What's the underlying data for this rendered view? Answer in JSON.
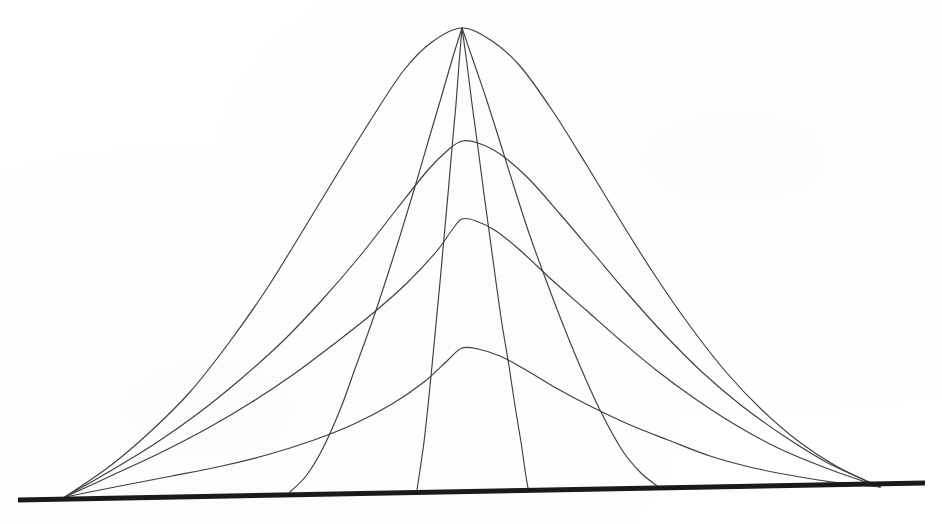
{
  "figure": {
    "title": "Family of bell-shaped curves with characteristic lines",
    "background_color": "#ffffff",
    "curve_color": "#3f3f3f",
    "baseline_color": "#1a1a1a",
    "curve_stroke_width": 1.15,
    "baseline_stroke_width": 5.0
  },
  "chart_data": {
    "type": "line",
    "title": "",
    "subtitle": "",
    "xlabel": "",
    "ylabel": "",
    "xlim": [
      18,
      925
    ],
    "ylim": [
      28,
      500
    ],
    "grid": false,
    "legend": "none",
    "axis": {
      "name": "baseline",
      "x_start": 18,
      "y_start": 500,
      "x_end": 925,
      "y_end": 483,
      "thickness_px": 5,
      "tilt": "slightly rising left-to-right"
    },
    "anchors": {
      "left_foot": {
        "x": 65,
        "y": 497
      },
      "right_foot": {
        "x": 880,
        "y": 487
      },
      "apex": {
        "x": 462,
        "y": 28
      }
    },
    "series": [
      {
        "name": "envelope-1-tallest",
        "kind": "bell",
        "peak_x": 462,
        "peak_y": 28,
        "peak_height_px": 469,
        "points": [
          [
            65,
            497
          ],
          [
            110,
            466
          ],
          [
            150,
            432
          ],
          [
            190,
            392
          ],
          [
            228,
            344
          ],
          [
            266,
            290
          ],
          [
            302,
            232
          ],
          [
            336,
            176
          ],
          [
            372,
            118
          ],
          [
            404,
            70
          ],
          [
            432,
            42
          ],
          [
            462,
            28
          ],
          [
            492,
            41
          ],
          [
            520,
            66
          ],
          [
            552,
            110
          ],
          [
            586,
            164
          ],
          [
            620,
            220
          ],
          [
            654,
            274
          ],
          [
            690,
            326
          ],
          [
            726,
            372
          ],
          [
            762,
            410
          ],
          [
            798,
            441
          ],
          [
            836,
            466
          ],
          [
            880,
            487
          ]
        ]
      },
      {
        "name": "envelope-2",
        "kind": "bell",
        "peak_x": 462,
        "peak_y": 141,
        "peak_height_px": 356,
        "points": [
          [
            65,
            497
          ],
          [
            112,
            470
          ],
          [
            156,
            443
          ],
          [
            200,
            412
          ],
          [
            242,
            378
          ],
          [
            284,
            340
          ],
          [
            322,
            300
          ],
          [
            360,
            256
          ],
          [
            396,
            210
          ],
          [
            428,
            170
          ],
          [
            448,
            150
          ],
          [
            462,
            141
          ],
          [
            478,
            143
          ],
          [
            500,
            154
          ],
          [
            528,
            178
          ],
          [
            560,
            214
          ],
          [
            594,
            254
          ],
          [
            628,
            294
          ],
          [
            664,
            334
          ],
          [
            702,
            372
          ],
          [
            742,
            406
          ],
          [
            784,
            436
          ],
          [
            828,
            463
          ],
          [
            880,
            487
          ]
        ]
      },
      {
        "name": "envelope-3",
        "kind": "bell",
        "peak_x": 462,
        "peak_y": 219,
        "peak_height_px": 278,
        "points": [
          [
            65,
            497
          ],
          [
            115,
            474
          ],
          [
            162,
            452
          ],
          [
            208,
            428
          ],
          [
            252,
            402
          ],
          [
            294,
            374
          ],
          [
            334,
            344
          ],
          [
            372,
            314
          ],
          [
            406,
            284
          ],
          [
            436,
            252
          ],
          [
            452,
            230
          ],
          [
            462,
            219
          ],
          [
            476,
            221
          ],
          [
            496,
            231
          ],
          [
            522,
            252
          ],
          [
            552,
            280
          ],
          [
            586,
            310
          ],
          [
            620,
            340
          ],
          [
            656,
            370
          ],
          [
            694,
            398
          ],
          [
            734,
            424
          ],
          [
            778,
            448
          ],
          [
            826,
            468
          ],
          [
            880,
            487
          ]
        ]
      },
      {
        "name": "envelope-4-lowest",
        "kind": "bell",
        "peak_x": 462,
        "peak_y": 348,
        "peak_height_px": 149,
        "points": [
          [
            65,
            497
          ],
          [
            120,
            486
          ],
          [
            172,
            476
          ],
          [
            222,
            466
          ],
          [
            270,
            454
          ],
          [
            314,
            440
          ],
          [
            354,
            424
          ],
          [
            392,
            404
          ],
          [
            424,
            382
          ],
          [
            448,
            360
          ],
          [
            462,
            348
          ],
          [
            478,
            349
          ],
          [
            500,
            356
          ],
          [
            526,
            370
          ],
          [
            556,
            388
          ],
          [
            590,
            406
          ],
          [
            628,
            424
          ],
          [
            668,
            440
          ],
          [
            710,
            456
          ],
          [
            754,
            468
          ],
          [
            800,
            477
          ],
          [
            840,
            483
          ],
          [
            880,
            487
          ]
        ]
      },
      {
        "name": "characteristic-1",
        "kind": "characteristic",
        "from": {
          "x": 462,
          "y": 28
        },
        "to": {
          "x": 290,
          "y": 492
        },
        "points": [
          [
            462,
            28
          ],
          [
            452,
            60
          ],
          [
            441,
            98
          ],
          [
            428,
            142
          ],
          [
            414,
            190
          ],
          [
            400,
            236
          ],
          [
            386,
            280
          ],
          [
            372,
            322
          ],
          [
            356,
            366
          ],
          [
            340,
            410
          ],
          [
            322,
            450
          ],
          [
            306,
            476
          ],
          [
            290,
            492
          ]
        ]
      },
      {
        "name": "characteristic-2",
        "kind": "characteristic",
        "from": {
          "x": 462,
          "y": 28
        },
        "to": {
          "x": 417,
          "y": 490
        },
        "points": [
          [
            462,
            28
          ],
          [
            459,
            64
          ],
          [
            456,
            104
          ],
          [
            452,
            148
          ],
          [
            448,
            194
          ],
          [
            444,
            238
          ],
          [
            440,
            282
          ],
          [
            436,
            324
          ],
          [
            432,
            366
          ],
          [
            428,
            406
          ],
          [
            424,
            442
          ],
          [
            420,
            470
          ],
          [
            417,
            490
          ]
        ]
      },
      {
        "name": "characteristic-3",
        "kind": "characteristic",
        "from": {
          "x": 462,
          "y": 28
        },
        "to": {
          "x": 528,
          "y": 488
        },
        "points": [
          [
            462,
            28
          ],
          [
            467,
            64
          ],
          [
            472,
            104
          ],
          [
            478,
            148
          ],
          [
            484,
            194
          ],
          [
            490,
            238
          ],
          [
            496,
            282
          ],
          [
            502,
            324
          ],
          [
            509,
            366
          ],
          [
            515,
            406
          ],
          [
            521,
            442
          ],
          [
            525,
            470
          ],
          [
            528,
            488
          ]
        ]
      },
      {
        "name": "characteristic-4",
        "kind": "characteristic",
        "from": {
          "x": 462,
          "y": 28
        },
        "to": {
          "x": 657,
          "y": 486
        },
        "points": [
          [
            462,
            28
          ],
          [
            473,
            60
          ],
          [
            486,
            98
          ],
          [
            500,
            142
          ],
          [
            515,
            190
          ],
          [
            530,
            236
          ],
          [
            546,
            280
          ],
          [
            562,
            322
          ],
          [
            580,
            366
          ],
          [
            600,
            410
          ],
          [
            622,
            450
          ],
          [
            640,
            472
          ],
          [
            657,
            486
          ]
        ]
      }
    ],
    "notes": [
      "All four bell curves share the same two baseline anchor points.",
      "All four characteristic curves share the same apex point.",
      "Peak amplitudes decrease: 469, 356, 278, 149 pixels above the baseline.",
      "Baseline foot positions of the characteristics: 290, 417, 528, 657."
    ]
  }
}
